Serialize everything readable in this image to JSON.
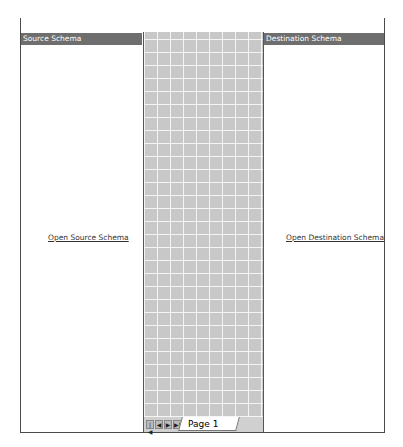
{
  "tabs": [
    {
      "label": "simpleMap.btm",
      "active": true
    },
    {
      "label": "destinationSchema.xsd",
      "active": false
    },
    {
      "label": "inputCustomer1.xsd",
      "active": false
    },
    {
      "label": "Start Page",
      "active": false
    }
  ],
  "window_controls": {
    "dropdown": "▾",
    "close": "✕"
  },
  "source_pane": {
    "header": "Source Schema",
    "link": "Open Source Schema"
  },
  "destination_pane": {
    "header": "Destination Schema",
    "link": "Open Destination Schema"
  },
  "page_nav": {
    "first": "|◀",
    "prev": "◀",
    "next": "▶",
    "last": "▶|",
    "page_label": "Page 1"
  },
  "colors": {
    "header_bg": "#6e6e6e",
    "grid_bg": "#c8c8c8",
    "frame_border": "#4a4a4a"
  }
}
